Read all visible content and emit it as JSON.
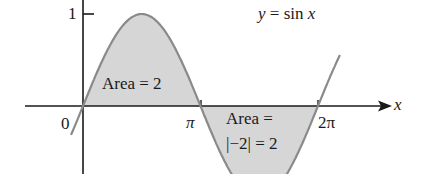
{
  "figure": {
    "function_label": "y = sin x",
    "function_label_parts": {
      "y": "y",
      "eq": " = sin ",
      "x": "x"
    },
    "x_axis_label": "x",
    "y_tick_label": "1",
    "x_ticks": {
      "origin": "0",
      "pi": "π",
      "two_pi": "2π"
    },
    "area_positive": "Area = 2",
    "area_negative_line1": "Area =",
    "area_negative_line2": "|−2| = 2"
  },
  "colors": {
    "curve": "#8a8a8a",
    "fill": "#d6d6d6",
    "axis": "#1a1a1a"
  }
}
